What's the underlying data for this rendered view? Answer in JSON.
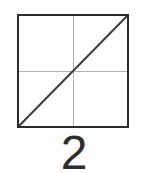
{
  "figure": {
    "width": 144,
    "height": 173,
    "background_color": "#ffffff",
    "caption": "2",
    "caption_color": "#2e2e2e"
  },
  "square": {
    "border_color": "#2b2b2b",
    "border_width_px": 2,
    "fill_color": "#ffffff",
    "left_px": 17,
    "top_px": 14,
    "width_px": 112,
    "height_px": 114
  },
  "grid_lines": {
    "color": "#b2b2b2",
    "horizontal_label": "horizontal center line",
    "vertical_label": "vertical center line"
  },
  "diagonal": {
    "color": "#3a3a3a",
    "width_px": 2,
    "from": "bottom-left",
    "to": "top-right",
    "x1": 0,
    "y1": 110,
    "x2": 108,
    "y2": 0
  }
}
